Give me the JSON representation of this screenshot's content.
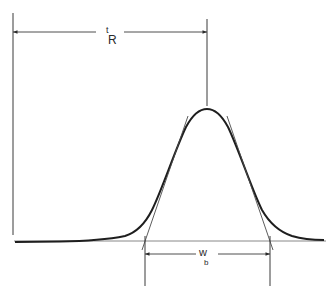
{
  "diagram": {
    "type": "chromatogram-peak",
    "background": "#ffffff",
    "ink_color": "#2a2a2a",
    "labels": {
      "retention_time": {
        "main": "t",
        "sub": "R"
      },
      "base_width": {
        "main": "w",
        "sub": "b"
      }
    },
    "geometry": {
      "baseline_y": 241,
      "injection_x": 13,
      "peak_x": 207,
      "peak_top_y": 109,
      "tangent_left_base_x": 145,
      "tangent_right_base_x": 270,
      "tR_arrow_y": 32,
      "wb_arrow_y": 254
    }
  }
}
